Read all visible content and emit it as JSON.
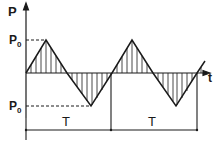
{
  "diagram": {
    "type": "triangular-wave",
    "y_axis_label": "P",
    "x_axis_label": "t",
    "amplitude_label_upper": "P",
    "amplitude_label_upper_sub": "0",
    "amplitude_label_lower": "P",
    "amplitude_label_lower_sub": "0",
    "period_labels": [
      "T",
      "T"
    ],
    "periods_shown": 2,
    "fill_style": "vertical-hatching",
    "colors": {
      "line": "#1a1a1a",
      "background": "#ffffff"
    }
  }
}
